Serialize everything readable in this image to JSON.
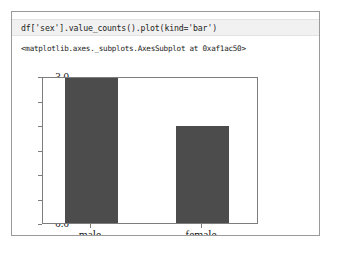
{
  "cell": {
    "code": "df['sex'].value_counts().plot(kind='bar')",
    "text_output": "<matplotlib.axes._subplots.AxesSubplot at 0xaf1ac50>"
  },
  "colors": {
    "bar": "#4c4c4c",
    "code_cell_background": "#f1f1f1",
    "frame_border": "#9a9a9a",
    "axes_spine": "#7d7d7d",
    "text": "#1c1c1c"
  },
  "chart_data": {
    "type": "bar",
    "title": "",
    "xlabel": "",
    "ylabel": "",
    "categories": [
      "male",
      "female"
    ],
    "values": [
      3,
      2
    ],
    "ylim": [
      0.0,
      3.0
    ],
    "yticks": [
      "0.0",
      "0.5",
      "1.0",
      "1.5",
      "2.0",
      "2.5",
      "3.0"
    ],
    "ytick_values": [
      0.0,
      0.5,
      1.0,
      1.5,
      2.0,
      2.5,
      3.0
    ],
    "grid": false,
    "legend": false,
    "series": [
      {
        "name": "sex",
        "values": [
          3,
          2
        ]
      }
    ]
  }
}
